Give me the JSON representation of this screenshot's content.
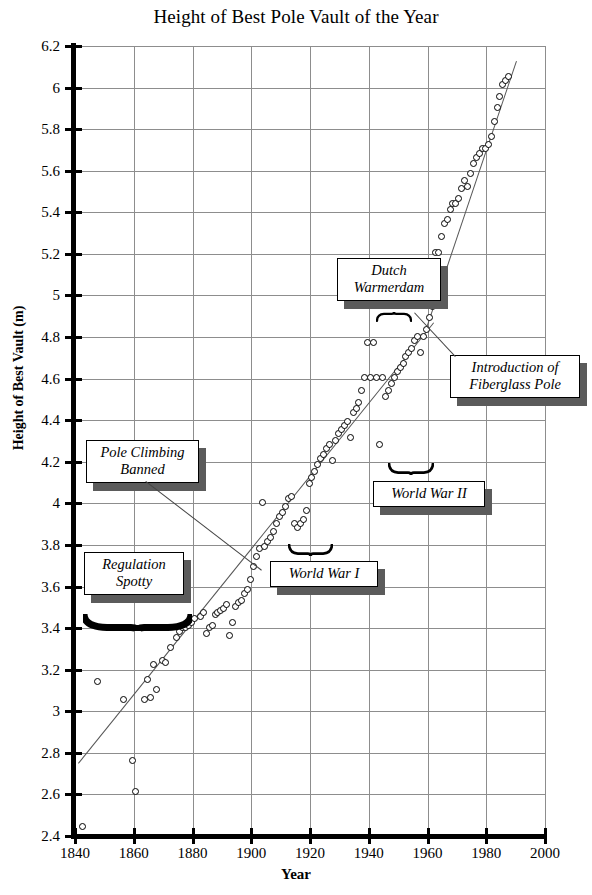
{
  "chart_data": {
    "type": "scatter",
    "title": "Height of Best Pole Vault of the Year",
    "xlabel": "Year",
    "ylabel": "Height of Best Vault (m)",
    "xlim": [
      1840,
      2000
    ],
    "ylim": [
      2.4,
      6.2
    ],
    "xticks": [
      1840,
      1860,
      1880,
      1900,
      1920,
      1940,
      1960,
      1980,
      2000
    ],
    "yticks": [
      2.4,
      2.6,
      2.8,
      3,
      3.2,
      3.4,
      3.6,
      3.8,
      4,
      4.2,
      4.4,
      4.6,
      4.8,
      5,
      5.2,
      5.4,
      5.6,
      5.8,
      6,
      6.2
    ],
    "grid": true,
    "legend": "none",
    "marker": "open-circle",
    "series": [
      {
        "name": "Best pole vault of the year",
        "points": [
          [
            1843,
            2.44
          ],
          [
            1848,
            3.14
          ],
          [
            1857,
            3.05
          ],
          [
            1860,
            2.76
          ],
          [
            1861,
            2.61
          ],
          [
            1864,
            3.05
          ],
          [
            1865,
            3.15
          ],
          [
            1866,
            3.06
          ],
          [
            1867,
            3.22
          ],
          [
            1868,
            3.1
          ],
          [
            1870,
            3.24
          ],
          [
            1871,
            3.23
          ],
          [
            1873,
            3.3
          ],
          [
            1875,
            3.35
          ],
          [
            1876,
            3.38
          ],
          [
            1877,
            3.4
          ],
          [
            1878,
            3.4
          ],
          [
            1879,
            3.41
          ],
          [
            1880,
            3.42
          ],
          [
            1881,
            3.44
          ],
          [
            1883,
            3.45
          ],
          [
            1884,
            3.47
          ],
          [
            1885,
            3.37
          ],
          [
            1886,
            3.4
          ],
          [
            1887,
            3.41
          ],
          [
            1888,
            3.46
          ],
          [
            1889,
            3.47
          ],
          [
            1890,
            3.48
          ],
          [
            1891,
            3.49
          ],
          [
            1892,
            3.51
          ],
          [
            1893,
            3.36
          ],
          [
            1894,
            3.42
          ],
          [
            1895,
            3.5
          ],
          [
            1896,
            3.52
          ],
          [
            1897,
            3.53
          ],
          [
            1898,
            3.56
          ],
          [
            1899,
            3.58
          ],
          [
            1900,
            3.63
          ],
          [
            1901,
            3.69
          ],
          [
            1902,
            3.74
          ],
          [
            1903,
            3.78
          ],
          [
            1904,
            4.0
          ],
          [
            1905,
            3.79
          ],
          [
            1906,
            3.81
          ],
          [
            1907,
            3.83
          ],
          [
            1908,
            3.86
          ],
          [
            1909,
            3.9
          ],
          [
            1910,
            3.93
          ],
          [
            1911,
            3.95
          ],
          [
            1912,
            3.98
          ],
          [
            1913,
            4.02
          ],
          [
            1914,
            4.03
          ],
          [
            1915,
            3.9
          ],
          [
            1916,
            3.88
          ],
          [
            1917,
            3.9
          ],
          [
            1918,
            3.92
          ],
          [
            1919,
            3.96
          ],
          [
            1920,
            4.09
          ],
          [
            1921,
            4.12
          ],
          [
            1922,
            4.15
          ],
          [
            1923,
            4.18
          ],
          [
            1924,
            4.21
          ],
          [
            1925,
            4.23
          ],
          [
            1926,
            4.26
          ],
          [
            1927,
            4.28
          ],
          [
            1928,
            4.2
          ],
          [
            1929,
            4.3
          ],
          [
            1930,
            4.33
          ],
          [
            1931,
            4.35
          ],
          [
            1932,
            4.37
          ],
          [
            1933,
            4.39
          ],
          [
            1934,
            4.31
          ],
          [
            1935,
            4.43
          ],
          [
            1936,
            4.45
          ],
          [
            1937,
            4.48
          ],
          [
            1938,
            4.54
          ],
          [
            1939,
            4.6
          ],
          [
            1940,
            4.77
          ],
          [
            1941,
            4.6
          ],
          [
            1942,
            4.77
          ],
          [
            1943,
            4.6
          ],
          [
            1944,
            4.28
          ],
          [
            1945,
            4.6
          ],
          [
            1946,
            4.51
          ],
          [
            1947,
            4.54
          ],
          [
            1948,
            4.57
          ],
          [
            1949,
            4.6
          ],
          [
            1950,
            4.63
          ],
          [
            1951,
            4.65
          ],
          [
            1952,
            4.67
          ],
          [
            1953,
            4.7
          ],
          [
            1954,
            4.72
          ],
          [
            1955,
            4.74
          ],
          [
            1956,
            4.78
          ],
          [
            1957,
            4.8
          ],
          [
            1958,
            4.72
          ],
          [
            1959,
            4.8
          ],
          [
            1960,
            4.83
          ],
          [
            1961,
            4.89
          ],
          [
            1962,
            4.94
          ],
          [
            1963,
            5.2
          ],
          [
            1964,
            5.2
          ],
          [
            1965,
            5.28
          ],
          [
            1966,
            5.34
          ],
          [
            1967,
            5.36
          ],
          [
            1968,
            5.41
          ],
          [
            1969,
            5.44
          ],
          [
            1970,
            5.44
          ],
          [
            1971,
            5.46
          ],
          [
            1972,
            5.51
          ],
          [
            1973,
            5.55
          ],
          [
            1974,
            5.52
          ],
          [
            1975,
            5.58
          ],
          [
            1976,
            5.63
          ],
          [
            1977,
            5.66
          ],
          [
            1978,
            5.68
          ],
          [
            1979,
            5.7
          ],
          [
            1980,
            5.7
          ],
          [
            1981,
            5.72
          ],
          [
            1982,
            5.76
          ],
          [
            1983,
            5.83
          ],
          [
            1984,
            5.9
          ],
          [
            1985,
            5.95
          ],
          [
            1986,
            6.01
          ],
          [
            1987,
            6.03
          ],
          [
            1988,
            6.05
          ]
        ]
      }
    ],
    "trend_lines": [
      {
        "name": "early-trend",
        "x1": 1841,
        "y1": 2.75,
        "x2": 1962,
        "y2": 4.87
      },
      {
        "name": "modern-trend",
        "x1": 1959,
        "y1": 4.83,
        "x2": 1990,
        "y2": 6.13
      }
    ],
    "annotations": [
      {
        "id": "pole-climbing-banned",
        "text": "Pole Climbing\nBanned",
        "target_x": 1917,
        "target_y": 3.48
      },
      {
        "id": "regulation-spotty",
        "text": "Regulation\nSpotty",
        "brace_from": 1842,
        "brace_to": 1877
      },
      {
        "id": "world-war-i",
        "text": "World War I",
        "brace_from": 1914,
        "brace_to": 1919
      },
      {
        "id": "world-war-ii",
        "text": "World War II",
        "brace_from": 1940,
        "brace_to": 1946
      },
      {
        "id": "dutch-warmerdam",
        "text": "Dutch\nWarmerdam",
        "brace_from": 1940,
        "brace_to": 1944
      },
      {
        "id": "introduction-of-fiberglass-pole",
        "text": "Introduction of\nFiberglass Pole",
        "target_x": 1955,
        "target_y": 5.02
      }
    ]
  },
  "annotation_labels": {
    "pole_climbing_banned": "Pole Climbing\nBanned",
    "regulation_spotty": "Regulation\nSpotty",
    "world_war_i": "World War I",
    "world_war_ii": "World War II",
    "dutch_warmerdam": "Dutch\nWarmerdam",
    "fiberglass": "Introduction of\nFiberglass Pole"
  }
}
